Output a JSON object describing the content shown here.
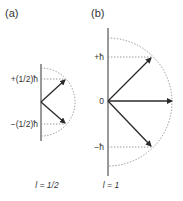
{
  "panels": [
    {
      "id": "a",
      "label": "(a)",
      "quantum_number": "l = 1/2",
      "levels": [
        {
          "label": "+(1/2)ħ",
          "value": 0.5
        },
        {
          "label": "−(1/2)ħ",
          "value": -0.5
        }
      ]
    },
    {
      "id": "b",
      "label": "(b)",
      "quantum_number": "l = 1",
      "levels": [
        {
          "label": "+ħ",
          "value": 1
        },
        {
          "label": "0",
          "value": 0
        },
        {
          "label": "−ħ",
          "value": -1
        }
      ]
    }
  ],
  "colors": {
    "axis": "#555555",
    "arrow": "#2a2a2a",
    "dotted": "#8a8a8a",
    "text": "#333333"
  }
}
